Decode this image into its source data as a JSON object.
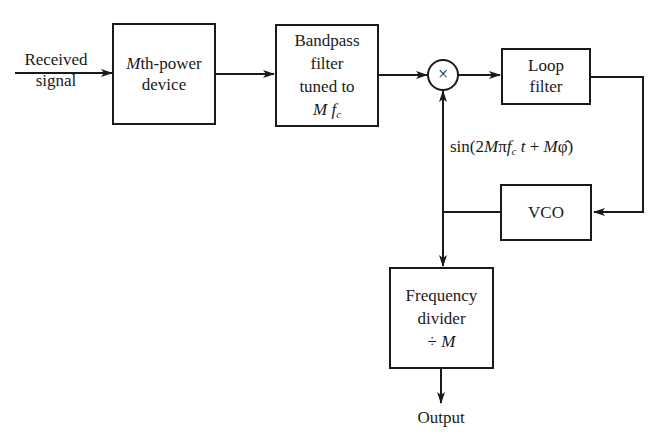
{
  "diagram": {
    "input_label": [
      "Received",
      "signal"
    ],
    "blocks": {
      "mth_power": {
        "prefix": "M",
        "line1_rest": "th-power",
        "line2": "device"
      },
      "bandpass": {
        "line1": "Bandpass",
        "line2": "filter",
        "line3": "tuned to",
        "line4_var": "M f",
        "line4_sub": "c"
      },
      "loop_filter": {
        "line1": "Loop",
        "line2": "filter"
      },
      "vco": {
        "label": "VCO"
      },
      "freq_divider": {
        "line1": "Frequency",
        "line2": "divider",
        "line3_op": "÷",
        "line3_var": "M"
      }
    },
    "multiplier_symbol": "×",
    "feedback_signal": {
      "pre": "sin(2",
      "M": "M",
      "pi": "π",
      "f": "f",
      "sub": "c",
      "t": " t",
      "plus": " + ",
      "M2": "M",
      "phi": "φ̂",
      "post": ")"
    },
    "output_label": "Output",
    "colors": {
      "line": "#1a1a1a",
      "background": "#ffffff"
    }
  }
}
